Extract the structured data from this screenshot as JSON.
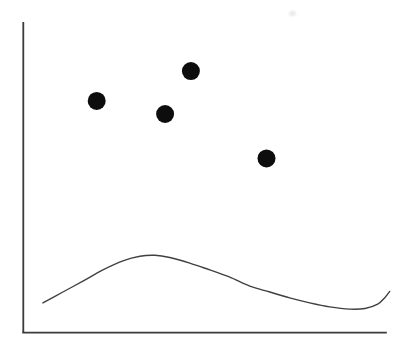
{
  "chart_data": {
    "type": "scatter",
    "title": "",
    "xlabel": "",
    "ylabel": "",
    "background": "#ffffff",
    "axis_color": "#3a3a3a",
    "axis_stroke_width_px": 1.8,
    "axes": {
      "x_range": [
        0,
        1
      ],
      "y_range": [
        0,
        1
      ],
      "tick_labels": "none",
      "grid": false,
      "legend": "none"
    },
    "series": [
      {
        "name": "scatter-points",
        "type": "scatter",
        "marker": "filled-circle",
        "color": "#0d0d0d",
        "marker_radius_px": 9,
        "points": [
          {
            "x": 0.202,
            "y": 0.746
          },
          {
            "x": 0.39,
            "y": 0.704
          },
          {
            "x": 0.461,
            "y": 0.842
          },
          {
            "x": 0.669,
            "y": 0.561
          }
        ]
      },
      {
        "name": "smooth-curve",
        "type": "line",
        "color": "#404040",
        "stroke_width_px": 1.4,
        "points": [
          {
            "x": 0.054,
            "y": 0.096
          },
          {
            "x": 0.109,
            "y": 0.131
          },
          {
            "x": 0.164,
            "y": 0.166
          },
          {
            "x": 0.219,
            "y": 0.202
          },
          {
            "x": 0.274,
            "y": 0.231
          },
          {
            "x": 0.321,
            "y": 0.246
          },
          {
            "x": 0.362,
            "y": 0.249
          },
          {
            "x": 0.403,
            "y": 0.242
          },
          {
            "x": 0.458,
            "y": 0.224
          },
          {
            "x": 0.513,
            "y": 0.202
          },
          {
            "x": 0.568,
            "y": 0.179
          },
          {
            "x": 0.623,
            "y": 0.15
          },
          {
            "x": 0.678,
            "y": 0.131
          },
          {
            "x": 0.733,
            "y": 0.112
          },
          {
            "x": 0.788,
            "y": 0.096
          },
          {
            "x": 0.843,
            "y": 0.083
          },
          {
            "x": 0.898,
            "y": 0.076
          },
          {
            "x": 0.94,
            "y": 0.078
          },
          {
            "x": 0.975,
            "y": 0.092
          },
          {
            "x": 0.994,
            "y": 0.112
          },
          {
            "x": 1.008,
            "y": 0.133
          }
        ]
      }
    ]
  }
}
